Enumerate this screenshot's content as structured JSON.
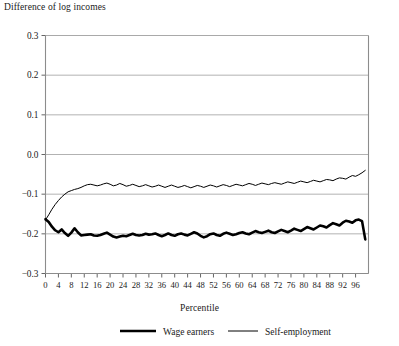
{
  "chart_data": {
    "type": "line",
    "title": "Difference of log incomes",
    "xlabel": "Percentile",
    "ylabel": "",
    "xlim": [
      0,
      100
    ],
    "ylim": [
      -0.3,
      0.3
    ],
    "grid": true,
    "legend_position": "bottom",
    "ytick_labels": [
      "0.3",
      "0.2",
      "0.1",
      "0.0",
      "−0.1",
      "−0.2",
      "−0.3"
    ],
    "ytick_values": [
      0.3,
      0.2,
      0.1,
      0.0,
      -0.1,
      -0.2,
      -0.3
    ],
    "xtick_labels": [
      "0",
      "4",
      "8",
      "12",
      "16",
      "20",
      "24",
      "28",
      "32",
      "36",
      "40",
      "44",
      "48",
      "52",
      "56",
      "60",
      "64",
      "68",
      "72",
      "76",
      "80",
      "84",
      "88",
      "92",
      "96"
    ],
    "xtick_values": [
      0,
      4,
      8,
      12,
      16,
      20,
      24,
      28,
      32,
      36,
      40,
      44,
      48,
      52,
      56,
      60,
      64,
      68,
      72,
      76,
      80,
      84,
      88,
      92,
      96
    ],
    "x": [
      0,
      1,
      2,
      3,
      4,
      5,
      6,
      7,
      8,
      9,
      10,
      11,
      12,
      13,
      14,
      15,
      16,
      17,
      18,
      19,
      20,
      21,
      22,
      23,
      24,
      25,
      26,
      27,
      28,
      29,
      30,
      31,
      32,
      33,
      34,
      35,
      36,
      37,
      38,
      39,
      40,
      41,
      42,
      43,
      44,
      45,
      46,
      47,
      48,
      49,
      50,
      51,
      52,
      53,
      54,
      55,
      56,
      57,
      58,
      59,
      60,
      61,
      62,
      63,
      64,
      65,
      66,
      67,
      68,
      69,
      70,
      71,
      72,
      73,
      74,
      75,
      76,
      77,
      78,
      79,
      80,
      81,
      82,
      83,
      84,
      85,
      86,
      87,
      88,
      89,
      90,
      91,
      92,
      93,
      94,
      95,
      96,
      97,
      98,
      99
    ],
    "series": [
      {
        "name": "Wage earners",
        "color": "#000000",
        "line_width": 2.6,
        "values": [
          -0.163,
          -0.17,
          -0.182,
          -0.191,
          -0.196,
          -0.189,
          -0.198,
          -0.205,
          -0.197,
          -0.186,
          -0.196,
          -0.204,
          -0.203,
          -0.202,
          -0.201,
          -0.204,
          -0.205,
          -0.203,
          -0.2,
          -0.197,
          -0.202,
          -0.207,
          -0.209,
          -0.207,
          -0.205,
          -0.206,
          -0.203,
          -0.2,
          -0.203,
          -0.204,
          -0.203,
          -0.2,
          -0.202,
          -0.201,
          -0.199,
          -0.203,
          -0.206,
          -0.203,
          -0.199,
          -0.203,
          -0.205,
          -0.201,
          -0.199,
          -0.202,
          -0.204,
          -0.2,
          -0.196,
          -0.199,
          -0.205,
          -0.209,
          -0.206,
          -0.201,
          -0.199,
          -0.203,
          -0.205,
          -0.2,
          -0.197,
          -0.2,
          -0.203,
          -0.201,
          -0.198,
          -0.196,
          -0.199,
          -0.201,
          -0.197,
          -0.193,
          -0.196,
          -0.198,
          -0.195,
          -0.192,
          -0.196,
          -0.198,
          -0.194,
          -0.19,
          -0.193,
          -0.196,
          -0.192,
          -0.187,
          -0.19,
          -0.193,
          -0.188,
          -0.183,
          -0.186,
          -0.189,
          -0.184,
          -0.179,
          -0.181,
          -0.184,
          -0.178,
          -0.173,
          -0.176,
          -0.179,
          -0.172,
          -0.167,
          -0.169,
          -0.172,
          -0.166,
          -0.164,
          -0.168,
          -0.214
        ]
      },
      {
        "name": "Self-employment",
        "color": "#000000",
        "line_width": 1.0,
        "values": [
          -0.165,
          -0.152,
          -0.138,
          -0.126,
          -0.116,
          -0.107,
          -0.1,
          -0.094,
          -0.091,
          -0.088,
          -0.086,
          -0.083,
          -0.079,
          -0.076,
          -0.075,
          -0.077,
          -0.079,
          -0.077,
          -0.074,
          -0.072,
          -0.075,
          -0.079,
          -0.077,
          -0.073,
          -0.076,
          -0.08,
          -0.078,
          -0.075,
          -0.078,
          -0.081,
          -0.079,
          -0.076,
          -0.079,
          -0.082,
          -0.08,
          -0.077,
          -0.08,
          -0.083,
          -0.08,
          -0.077,
          -0.08,
          -0.083,
          -0.081,
          -0.078,
          -0.081,
          -0.084,
          -0.081,
          -0.078,
          -0.08,
          -0.083,
          -0.08,
          -0.077,
          -0.079,
          -0.082,
          -0.079,
          -0.076,
          -0.078,
          -0.081,
          -0.078,
          -0.075,
          -0.077,
          -0.079,
          -0.076,
          -0.073,
          -0.075,
          -0.078,
          -0.075,
          -0.072,
          -0.074,
          -0.076,
          -0.073,
          -0.071,
          -0.073,
          -0.075,
          -0.072,
          -0.069,
          -0.071,
          -0.073,
          -0.07,
          -0.067,
          -0.069,
          -0.071,
          -0.068,
          -0.065,
          -0.067,
          -0.069,
          -0.066,
          -0.063,
          -0.064,
          -0.066,
          -0.062,
          -0.059,
          -0.06,
          -0.062,
          -0.057,
          -0.053,
          -0.055,
          -0.051,
          -0.046,
          -0.04
        ]
      }
    ]
  }
}
